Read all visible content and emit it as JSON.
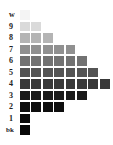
{
  "chart_data": {
    "type": "heatmap",
    "title": "",
    "rows": [
      {
        "label": "w",
        "count": 1,
        "color": "#f4f4f4"
      },
      {
        "label": "9",
        "count": 2,
        "color": "#dadada"
      },
      {
        "label": "8",
        "count": 3,
        "color": "#b4b4b4"
      },
      {
        "label": "7",
        "count": 5,
        "color": "#909090"
      },
      {
        "label": "6",
        "count": 6,
        "color": "#727272"
      },
      {
        "label": "5",
        "count": 7,
        "color": "#545454"
      },
      {
        "label": "4",
        "count": 8,
        "color": "#383838"
      },
      {
        "label": "3",
        "count": 6,
        "color": "#1a1a1a"
      },
      {
        "label": "2",
        "count": 4,
        "color": "#0e0e0e"
      },
      {
        "label": "1",
        "count": 1,
        "color": "#0a0a0a"
      },
      {
        "label": "bk",
        "count": 1,
        "color": "#080808"
      }
    ]
  }
}
